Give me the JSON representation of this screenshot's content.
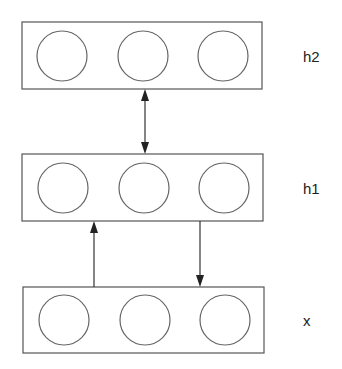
{
  "diagram": {
    "type": "layered neural network (deep belief network style)",
    "layers": [
      {
        "id": "h2",
        "label": "h2",
        "units": 3
      },
      {
        "id": "h1",
        "label": "h1",
        "units": 3
      },
      {
        "id": "x",
        "label": "x",
        "units": 3
      }
    ],
    "connections": [
      {
        "from": "h1",
        "to": "h2",
        "direction": "bidirectional"
      },
      {
        "from": "x",
        "to": "h1",
        "direction": "up"
      },
      {
        "from": "h1",
        "to": "x",
        "direction": "down"
      }
    ],
    "colors": {
      "stroke": "#555555",
      "arrow": "#222222",
      "background": "#ffffff"
    }
  }
}
